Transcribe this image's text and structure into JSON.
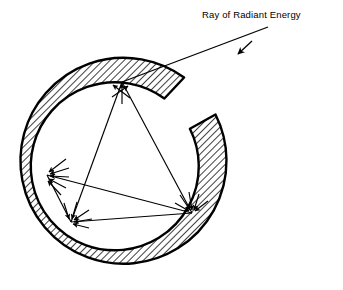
{
  "figure": {
    "background_color": "#ffffff",
    "ink_color": "#000000",
    "title_label": "Ray of Radiant Energy",
    "label_position": {
      "x": 202,
      "y": 18
    }
  },
  "cavity": {
    "name": "integrating-sphere-wall",
    "center": {
      "x": 125,
      "y": 163
    },
    "outer_radius": 103,
    "inner_radius": 84,
    "wall_thickness": 19,
    "hatch_angle_deg": 45,
    "hatch_spacing": 5,
    "aperture": {
      "name": "entrance-aperture",
      "start_angle_deg": -55,
      "end_angle_deg": -28,
      "note": "gap in the wall at upper right where the ray enters"
    }
  },
  "incoming_ray": {
    "name": "ray-of-radiant-energy",
    "start": {
      "x": 268,
      "y": 27
    },
    "end": {
      "x": 122,
      "y": 82
    },
    "arrowhead_at": {
      "x": 238,
      "y": 54
    },
    "arrowhead_angle_deg": 200
  },
  "reflection_points": [
    {
      "name": "reflection-point-top",
      "x": 122,
      "y": 82,
      "label": "top wall"
    },
    {
      "name": "reflection-point-bottom-left",
      "x": 71,
      "y": 222,
      "label": "lower left wall"
    },
    {
      "name": "reflection-point-bottom-right",
      "x": 192,
      "y": 213,
      "label": "lower right wall"
    },
    {
      "name": "reflection-point-left",
      "x": 47,
      "y": 175,
      "label": "left wall"
    }
  ],
  "ray_path_segments": [
    {
      "name": "segment-entry",
      "from": {
        "x": 268,
        "y": 27
      },
      "to": {
        "x": 122,
        "y": 82
      }
    },
    {
      "name": "segment-top-to-bottom-left",
      "from": {
        "x": 122,
        "y": 82
      },
      "to": {
        "x": 71,
        "y": 222
      }
    },
    {
      "name": "segment-top-to-bottom-right",
      "from": {
        "x": 122,
        "y": 82
      },
      "to": {
        "x": 192,
        "y": 213
      }
    },
    {
      "name": "segment-bottom-left-to-bottom-right",
      "from": {
        "x": 71,
        "y": 222
      },
      "to": {
        "x": 192,
        "y": 213
      }
    },
    {
      "name": "segment-left-to-bottom-right",
      "from": {
        "x": 47,
        "y": 175
      },
      "to": {
        "x": 192,
        "y": 213
      }
    },
    {
      "name": "segment-left-to-bottom-left",
      "from": {
        "x": 47,
        "y": 175
      },
      "to": {
        "x": 71,
        "y": 222
      }
    }
  ],
  "scatter_fans": [
    {
      "name": "scatter-fan-top",
      "origin": {
        "x": 122,
        "y": 82
      },
      "angles_deg": [
        -90,
        -118,
        -62
      ],
      "lengths": [
        22,
        18,
        16
      ]
    },
    {
      "name": "scatter-fan-left",
      "origin": {
        "x": 47,
        "y": 175
      },
      "angles_deg": [
        -60,
        -35,
        -10,
        12,
        34
      ],
      "lengths": [
        19,
        21,
        22,
        20,
        18
      ]
    },
    {
      "name": "scatter-fan-bottom-left",
      "origin": {
        "x": 71,
        "y": 222
      },
      "angles_deg": [
        -108,
        -72,
        -34,
        -8,
        14
      ],
      "lengths": [
        20,
        20,
        22,
        21,
        19
      ]
    },
    {
      "name": "scatter-fan-bottom-right",
      "origin": {
        "x": 192,
        "y": 213
      },
      "angles_deg": [
        -150,
        -124,
        -98,
        -72,
        -46
      ],
      "lengths": [
        20,
        22,
        21,
        20,
        19
      ]
    }
  ]
}
